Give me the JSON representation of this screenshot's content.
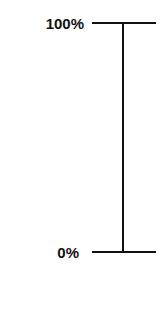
{
  "scale": {
    "top_label": "100%",
    "bottom_label": "0%",
    "line_color": "#111111"
  }
}
